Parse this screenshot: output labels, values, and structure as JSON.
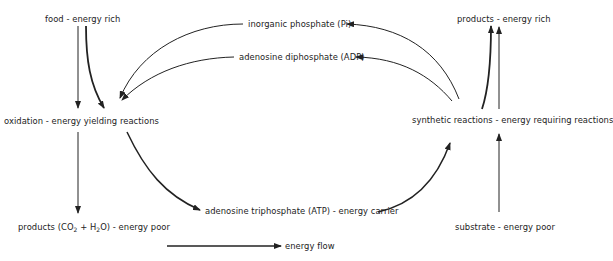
{
  "diagram": {
    "title": "",
    "nodes": {
      "food": "food - energy rich",
      "oxidation": "oxidation - energy yielding reactions",
      "products_poor_prefix": "products (CO",
      "products_poor_sub1": "2",
      "products_poor_mid": " + H",
      "products_poor_sub2": "2",
      "products_poor_suffix": "O) - energy poor",
      "pi": "inorganic phosphate (Pi)",
      "adp": "adenosine diphosphate (ADP)",
      "atp": "adenosine triphosphate (ATP) - energy carrier",
      "products_rich": "products - energy rich",
      "synthetic": "synthetic reactions - energy requiring reactions",
      "substrate": "substrate - energy poor"
    },
    "legend": {
      "energy_flow": "energy flow"
    },
    "edges": [
      {
        "from": "food",
        "to": "oxidation",
        "style": "thin"
      },
      {
        "from": "food",
        "to": "oxidation",
        "style": "thick"
      },
      {
        "from": "oxidation",
        "to": "products_poor",
        "style": "thin"
      },
      {
        "from": "oxidation",
        "to": "atp",
        "style": "thick"
      },
      {
        "from": "atp",
        "to": "synthetic",
        "style": "thick"
      },
      {
        "from": "synthetic",
        "to": "pi",
        "style": "thin"
      },
      {
        "from": "synthetic",
        "to": "adp",
        "style": "thin"
      },
      {
        "from": "pi",
        "to": "oxidation",
        "style": "thin"
      },
      {
        "from": "adp",
        "to": "oxidation",
        "style": "thin"
      },
      {
        "from": "synthetic",
        "to": "products_rich",
        "style": "thick"
      },
      {
        "from": "substrate",
        "to": "synthetic",
        "style": "thin"
      },
      {
        "from": "synthetic",
        "to": "products_rich",
        "style": "thin"
      }
    ],
    "colors": {
      "ink": "#222222",
      "background": "#ffffff"
    }
  }
}
